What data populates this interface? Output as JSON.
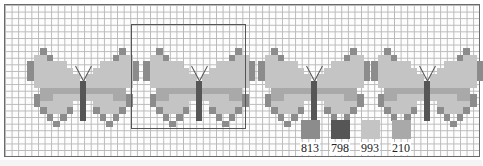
{
  "pattern": {
    "title": "Butterfly cross-stitch border chart",
    "cell_size_px": 6.6,
    "grid_line_color": "#b9b9b9",
    "border_color": "#6a6a6a",
    "butterfly_bitmap": [
      "..A...........A..",
      ".CCA.........ACC.",
      "ACCCCC.....CCCCCA",
      "ACCCCCC...CCCCCCA",
      "ACCCCCCC.CCCCCCCA",
      ".CCCCCCCBCCCCCCC.",
      "..DDDDDDBDDDDDD..",
      ".ADDCCCCBCCCCDDA.",
      ".ACCCCC.B.CCCCCA.",
      "..ACCCA.B.ACCCA..",
      "...A.A..B..A.A...",
      "....A.......A...."
    ],
    "butterflies": [
      {
        "id": "butterfly-1",
        "left": 22,
        "top": 43
      },
      {
        "id": "butterfly-2",
        "left": 138,
        "top": 43
      },
      {
        "id": "butterfly-3",
        "left": 253,
        "top": 43
      },
      {
        "id": "butterfly-4",
        "left": 366,
        "top": 43
      }
    ],
    "highlight_box": {
      "left": 130,
      "top": 23,
      "width": 115,
      "height": 105
    }
  },
  "key": {
    "threads": [
      {
        "code": "813",
        "color": "#8c8c8c",
        "role": "wing edge"
      },
      {
        "code": "798",
        "color": "#565656",
        "role": "body"
      },
      {
        "code": "993",
        "color": "#c4c4c4",
        "role": "wing fill"
      },
      {
        "code": "210",
        "color": "#a9a9a9",
        "role": "wing band"
      }
    ],
    "symbol_map": {
      "A": "813",
      "B": "798",
      "C": "993",
      "D": "210"
    }
  }
}
